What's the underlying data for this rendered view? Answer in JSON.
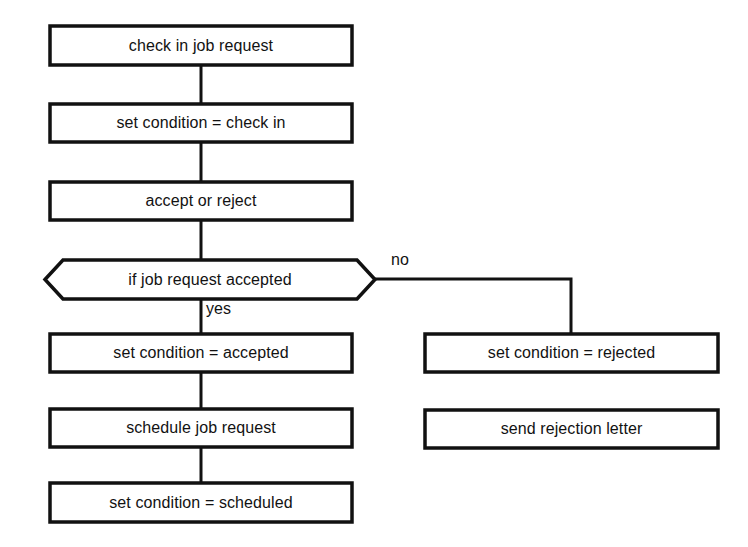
{
  "diagram": {
    "type": "flowchart",
    "stroke_color": "#111111",
    "fill_color": "#ffffff",
    "text_color": "#121212",
    "nodes": [
      {
        "id": "check-in-job-request",
        "shape": "process",
        "label": "check in job request",
        "x": 50,
        "y": 26,
        "w": 302,
        "h": 39
      },
      {
        "id": "set-condition-check-in",
        "shape": "process",
        "label": "set condition = check in",
        "x": 50,
        "y": 104,
        "w": 302,
        "h": 38
      },
      {
        "id": "accept-or-reject",
        "shape": "process",
        "label": "accept or reject",
        "x": 50,
        "y": 182,
        "w": 302,
        "h": 38
      },
      {
        "id": "if-job-request-accepted",
        "shape": "decision-hexagon",
        "label": "if job request accepted",
        "x": 45,
        "y": 260,
        "w": 330,
        "h": 39
      },
      {
        "id": "set-condition-accepted",
        "shape": "process",
        "label": "set condition = accepted",
        "x": 50,
        "y": 334,
        "w": 302,
        "h": 38
      },
      {
        "id": "schedule-job-request",
        "shape": "process",
        "label": "schedule job request",
        "x": 50,
        "y": 409,
        "w": 302,
        "h": 38
      },
      {
        "id": "set-condition-scheduled",
        "shape": "process",
        "label": "set condition = scheduled",
        "x": 50,
        "y": 483,
        "w": 302,
        "h": 39
      },
      {
        "id": "set-condition-rejected",
        "shape": "process",
        "label": "set condition = rejected",
        "x": 425,
        "y": 334,
        "w": 293,
        "h": 38
      },
      {
        "id": "send-rejection-letter",
        "shape": "process",
        "label": "send rejection letter",
        "x": 425,
        "y": 410,
        "w": 293,
        "h": 38
      }
    ],
    "edges": [
      {
        "id": "edge-check-in-to-set-check-in",
        "from": "check-in-job-request",
        "to": "set-condition-check-in",
        "label": "",
        "points": "201,65 201,104"
      },
      {
        "id": "edge-set-check-in-to-accept",
        "from": "set-condition-check-in",
        "to": "accept-or-reject",
        "label": "",
        "points": "201,142 201,182"
      },
      {
        "id": "edge-accept-to-decision",
        "from": "accept-or-reject",
        "to": "if-job-request-accepted",
        "label": "",
        "points": "201,220 201,260"
      },
      {
        "id": "edge-decision-yes-to-accepted",
        "from": "if-job-request-accepted",
        "to": "set-condition-accepted",
        "label": "yes",
        "points": "201,299 201,334"
      },
      {
        "id": "edge-decision-no-to-rejected",
        "from": "if-job-request-accepted",
        "to": "set-condition-rejected",
        "label": "no",
        "points": "375,279 571,279 571,334"
      },
      {
        "id": "edge-accepted-to-schedule",
        "from": "set-condition-accepted",
        "to": "schedule-job-request",
        "label": "",
        "points": "201,372 201,409"
      },
      {
        "id": "edge-schedule-to-scheduled",
        "from": "schedule-job-request",
        "to": "set-condition-scheduled",
        "label": "",
        "points": "201,447 201,483"
      }
    ],
    "edge_labels": [
      {
        "id": "yes-label",
        "text": "yes",
        "x": 206,
        "y": 300
      },
      {
        "id": "no-label",
        "text": "no",
        "x": 391,
        "y": 251
      }
    ]
  }
}
